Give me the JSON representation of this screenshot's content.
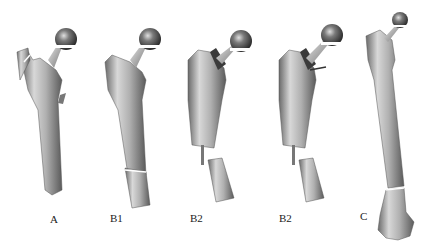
{
  "figure": {
    "panels": [
      {
        "id": "A",
        "label": "A",
        "label_x": 50,
        "label_y": 213
      },
      {
        "id": "B1",
        "label": "B1",
        "label_x": 110,
        "label_y": 212
      },
      {
        "id": "B2a",
        "label": "B2",
        "label_x": 190,
        "label_y": 212
      },
      {
        "id": "B2b",
        "label": "B2",
        "label_x": 279,
        "label_y": 212
      },
      {
        "id": "C",
        "label": "C",
        "label_x": 360,
        "label_y": 210
      }
    ],
    "colors": {
      "bone_light": "#d9d9d9",
      "bone_mid": "#a8a8a8",
      "bone_dark": "#5a5a5a",
      "head_dark": "#2e2e2e",
      "background": "#ffffff",
      "label": "#222222"
    }
  }
}
